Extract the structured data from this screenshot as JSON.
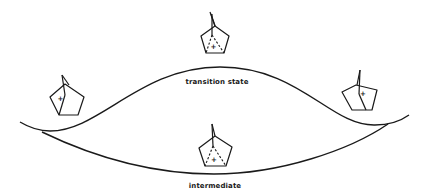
{
  "diagram": {
    "type": "energy-surface",
    "labels": {
      "transition_state": "transition state",
      "intermediate": "intermediate"
    },
    "curves": [
      {
        "name": "transition-state-curve",
        "shape": "hump",
        "peak_label": "transition state"
      },
      {
        "name": "intermediate-curve",
        "shape": "well",
        "minimum_label": "intermediate"
      }
    ],
    "structures": [
      {
        "name": "classical-cation-left",
        "position": "left-minimum",
        "charge": "+",
        "bridging": "classical"
      },
      {
        "name": "nonclassical-cation-top",
        "position": "above-transition-state",
        "charge": "+",
        "bridging": "nonclassical-dashed"
      },
      {
        "name": "classical-cation-right",
        "position": "right-minimum",
        "charge": "+",
        "bridging": "classical"
      },
      {
        "name": "nonclassical-cation-bottom",
        "position": "intermediate-well",
        "charge": "+",
        "bridging": "nonclassical-dashed"
      }
    ],
    "colors": {
      "ink": "#1a1a1a",
      "background": "#ffffff"
    }
  }
}
